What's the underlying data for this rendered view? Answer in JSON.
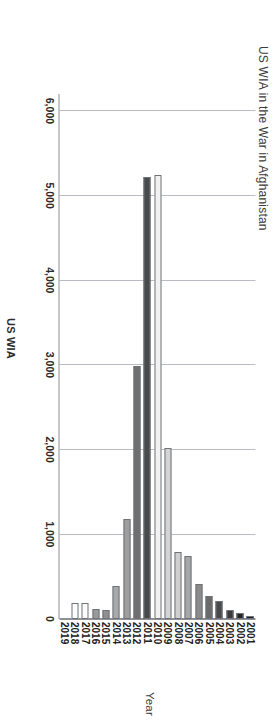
{
  "chart_data": {
    "type": "bar",
    "orientation": "horizontal",
    "title": "US WIA in the War in Afghanistan",
    "xlabel": "US WIA",
    "ylabel": "Year",
    "categories": [
      "2001",
      "2002",
      "2003",
      "2004",
      "2005",
      "2006",
      "2007",
      "2008",
      "2009",
      "2010",
      "2011",
      "2012",
      "2013",
      "2014",
      "2015",
      "2016",
      "2017",
      "2018",
      "2019"
    ],
    "values": [
      33,
      74,
      101,
      215,
      272,
      415,
      748,
      795,
      2020,
      5247,
      5224,
      2985,
      1176,
      395,
      110,
      115,
      185,
      190,
      0
    ],
    "tick_labels": [
      "6,000",
      "5,000",
      "4,000",
      "3,000",
      "2,000",
      "1,000",
      "0"
    ],
    "tick_values": [
      6000,
      5000,
      4000,
      3000,
      2000,
      1000,
      0
    ],
    "xlim": [
      0,
      6200
    ],
    "grid": true,
    "legend": "none",
    "bar_colors": [
      "#1a1a1a",
      "#232323",
      "#3a3a3a",
      "#4a4a4a",
      "#6b6b6b",
      "#8b8b8b",
      "#a8a8a8",
      "#cfcfcf",
      "#d4d4d4",
      "#f1f1f1",
      "#4a4a4a",
      "#6f6f6f",
      "#9e9e9e",
      "#a9a9a9",
      "#8f8f8f",
      "#9a9a9a",
      "#fbfbfb",
      "#fdfdfd",
      "#ffffff"
    ],
    "grid_color": "#b9bcc2",
    "axis_color": "#8d9096",
    "bar_border_color": "#6f7277",
    "text_color": "#2b2b2b"
  }
}
